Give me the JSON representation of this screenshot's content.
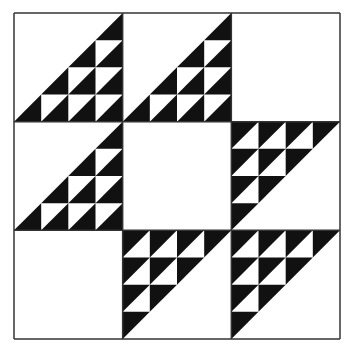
{
  "figure": {
    "kind": "quilt-block",
    "grid": 3,
    "colors": {
      "background": "#ffffff",
      "fill": "#111111",
      "border": "#333333"
    },
    "frame": {
      "x": 14,
      "y": 13,
      "size": 326
    },
    "subdivisions": 4,
    "cells": [
      [
        "lower-right",
        "lower-right",
        "blank"
      ],
      [
        "lower-right",
        "blank",
        "upper-left"
      ],
      [
        "blank",
        "upper-left",
        "upper-left"
      ]
    ]
  }
}
